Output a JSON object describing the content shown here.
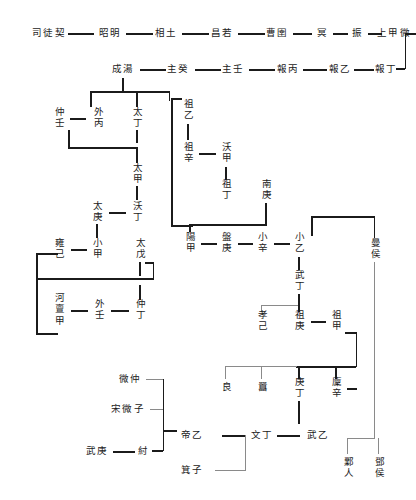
{
  "diagram": {
    "type": "genealogy-tree",
    "line_color": "#1b1b1b",
    "accent_line_color": "#8a8a8a",
    "nodes": [
      {
        "id": "sikuangqi",
        "label": "司徒契",
        "orient": "horiz",
        "x": 49,
        "y": 33
      },
      {
        "id": "zhaoming",
        "label": "昭明",
        "orient": "horiz",
        "x": 110,
        "y": 33
      },
      {
        "id": "xiangtu",
        "label": "相土",
        "orient": "horiz",
        "x": 166,
        "y": 33
      },
      {
        "id": "changruo",
        "label": "昌若",
        "orient": "horiz",
        "x": 222,
        "y": 33
      },
      {
        "id": "caoyu",
        "label": "曹圉",
        "orient": "horiz",
        "x": 277,
        "y": 33
      },
      {
        "id": "ming",
        "label": "冥",
        "orient": "horiz",
        "x": 323,
        "y": 33
      },
      {
        "id": "zhen",
        "label": "振",
        "orient": "horiz",
        "x": 358,
        "y": 33
      },
      {
        "id": "shangjiawei",
        "label": "上甲微",
        "orient": "horiz",
        "x": 394,
        "y": 33
      },
      {
        "id": "chengtang",
        "label": "成湯",
        "orient": "horiz",
        "x": 123,
        "y": 69
      },
      {
        "id": "zhugui",
        "label": "主癸",
        "orient": "horiz",
        "x": 178,
        "y": 69
      },
      {
        "id": "zhuren",
        "label": "主壬",
        "orient": "horiz",
        "x": 233,
        "y": 69
      },
      {
        "id": "baobing",
        "label": "報丙",
        "orient": "horiz",
        "x": 288,
        "y": 69
      },
      {
        "id": "baoyi",
        "label": "報乙",
        "orient": "horiz",
        "x": 340,
        "y": 69
      },
      {
        "id": "baoding",
        "label": "報丁",
        "orient": "horiz",
        "x": 386,
        "y": 69
      },
      {
        "id": "zhongren",
        "label": "仲壬",
        "orient": "vert",
        "x": 59,
        "y": 118
      },
      {
        "id": "waibing",
        "label": "外丙",
        "orient": "vert",
        "x": 98,
        "y": 118
      },
      {
        "id": "taiding",
        "label": "太丁",
        "orient": "vert",
        "x": 137,
        "y": 118
      },
      {
        "id": "zuyi",
        "label": "祖乙",
        "orient": "vert",
        "x": 188,
        "y": 110
      },
      {
        "id": "zuxin",
        "label": "祖辛",
        "orient": "vert",
        "x": 188,
        "y": 153
      },
      {
        "id": "woujia",
        "label": "沃甲",
        "orient": "vert",
        "x": 226,
        "y": 153
      },
      {
        "id": "zuding",
        "label": "祖丁",
        "orient": "vert",
        "x": 226,
        "y": 190
      },
      {
        "id": "nangeng",
        "label": "南庚",
        "orient": "vert",
        "x": 266,
        "y": 190
      },
      {
        "id": "taijia",
        "label": "太甲",
        "orient": "vert",
        "x": 137,
        "y": 174
      },
      {
        "id": "wouding",
        "label": "沃丁",
        "orient": "vert",
        "x": 137,
        "y": 212
      },
      {
        "id": "taigeng",
        "label": "太庚",
        "orient": "vert",
        "x": 97,
        "y": 212
      },
      {
        "id": "xiaojia",
        "label": "小甲",
        "orient": "vert",
        "x": 97,
        "y": 249
      },
      {
        "id": "yongji",
        "label": "雍己",
        "orient": "vert",
        "x": 59,
        "y": 249
      },
      {
        "id": "taiwu",
        "label": "太戊",
        "orient": "vert",
        "x": 140,
        "y": 249
      },
      {
        "id": "yangjia",
        "label": "陽甲",
        "orient": "vert",
        "x": 190,
        "y": 243
      },
      {
        "id": "pangeng",
        "label": "盤庚",
        "orient": "vert",
        "x": 226,
        "y": 243
      },
      {
        "id": "xiaoxin",
        "label": "小辛",
        "orient": "vert",
        "x": 262,
        "y": 243
      },
      {
        "id": "xiaoyi",
        "label": "小乙",
        "orient": "vert",
        "x": 299,
        "y": 243
      },
      {
        "id": "wuding",
        "label": "武丁",
        "orient": "vert",
        "x": 299,
        "y": 281
      },
      {
        "id": "manhou",
        "label": "曼侯",
        "orient": "vert",
        "x": 375,
        "y": 249
      },
      {
        "id": "hedanjia",
        "label": "河亶甲",
        "orient": "vert",
        "x": 59,
        "y": 310
      },
      {
        "id": "wairen",
        "label": "外壬",
        "orient": "vert",
        "x": 99,
        "y": 310
      },
      {
        "id": "zhongding",
        "label": "仲丁",
        "orient": "vert",
        "x": 140,
        "y": 310
      },
      {
        "id": "xiaoji",
        "label": "孝己",
        "orient": "vert",
        "x": 262,
        "y": 321
      },
      {
        "id": "zugeng",
        "label": "祖庚",
        "orient": "vert",
        "x": 299,
        "y": 321
      },
      {
        "id": "zujia",
        "label": "祖甲",
        "orient": "vert",
        "x": 336,
        "y": 321
      },
      {
        "id": "liang",
        "label": "良",
        "orient": "vert",
        "x": 226,
        "y": 388
      },
      {
        "id": "xiao",
        "label": "囂",
        "orient": "vert",
        "x": 262,
        "y": 388
      },
      {
        "id": "gengding",
        "label": "庚丁",
        "orient": "vert",
        "x": 299,
        "y": 388
      },
      {
        "id": "linxin",
        "label": "廩辛",
        "orient": "vert",
        "x": 336,
        "y": 388
      },
      {
        "id": "weizhong",
        "label": "微仲",
        "orient": "horiz",
        "x": 130,
        "y": 379
      },
      {
        "id": "songweizi",
        "label": "宋微子",
        "orient": "horiz",
        "x": 128,
        "y": 409
      },
      {
        "id": "wugeng",
        "label": "武庚",
        "orient": "horiz",
        "x": 97,
        "y": 451
      },
      {
        "id": "zhou",
        "label": "紂",
        "orient": "horiz",
        "x": 144,
        "y": 451
      },
      {
        "id": "diyi",
        "label": "帝乙",
        "orient": "horiz",
        "x": 192,
        "y": 435
      },
      {
        "id": "jizi",
        "label": "箕子",
        "orient": "horiz",
        "x": 192,
        "y": 470
      },
      {
        "id": "wending",
        "label": "文丁",
        "orient": "horiz",
        "x": 262,
        "y": 435
      },
      {
        "id": "wuyi",
        "label": "武乙",
        "orient": "horiz",
        "x": 318,
        "y": 435
      },
      {
        "id": "yeren",
        "label": "鄴人",
        "orient": "vert",
        "x": 348,
        "y": 468
      },
      {
        "id": "denghou",
        "label": "鄧侯",
        "orient": "vert",
        "x": 379,
        "y": 468
      }
    ]
  }
}
